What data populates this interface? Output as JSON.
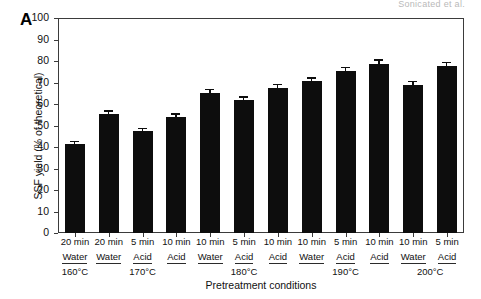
{
  "running_head": "Sonicated et al.",
  "panel_letter": "A",
  "chart_data": {
    "type": "bar",
    "title": "",
    "xlabel": "Pretreatment conditions",
    "ylabel": "SSF yield (% of theoretical)",
    "ylim": [
      0,
      100
    ],
    "yticks": [
      0,
      10,
      20,
      30,
      40,
      50,
      60,
      70,
      80,
      90,
      100
    ],
    "ytick_labels": [
      "0",
      "10",
      "20",
      "30",
      "40",
      "50",
      "60",
      "70",
      "80",
      "90",
      "100"
    ],
    "grid": false,
    "legend": "none",
    "bar_color": "#0d0d0d",
    "categories": [
      "20 min Acid 160°C",
      "20 min Water 170°C",
      "5 min Acid 170°C",
      "10 min Acid 170°C",
      "10 min Water 180°C",
      "5 min Acid 180°C",
      "10 min Acid 180°C",
      "10 min Water 190°C",
      "5 min Acid 190°C",
      "10 min Acid 190°C",
      "10 min Water 200°C",
      "5 min Acid 200°C"
    ],
    "values": [
      41.3,
      55.2,
      47.4,
      54.0,
      65.0,
      62.0,
      67.6,
      70.5,
      75.2,
      78.8,
      69.0,
      77.5
    ],
    "errors": [
      0.9,
      1.2,
      0.8,
      1.0,
      1.3,
      1.0,
      1.1,
      1.2,
      1.4,
      1.3,
      1.1,
      1.4
    ],
    "bars": [
      {
        "time": "20 min",
        "medium": "Water",
        "temp": "160°C",
        "value": 41.3,
        "error": 0.9
      },
      {
        "time": "20 min",
        "medium": "Water",
        "temp": "170°C",
        "value": 55.2,
        "error": 1.2
      },
      {
        "time": "5 min",
        "medium": "Acid",
        "temp": "170°C",
        "value": 47.4,
        "error": 0.8
      },
      {
        "time": "10 min",
        "medium": "Acid",
        "temp": "170°C",
        "value": 54.0,
        "error": 1.0
      },
      {
        "time": "10 min",
        "medium": "Water",
        "temp": "180°C",
        "value": 65.0,
        "error": 1.3
      },
      {
        "time": "5 min",
        "medium": "Acid",
        "temp": "180°C",
        "value": 62.0,
        "error": 1.0
      },
      {
        "time": "10 min",
        "medium": "Acid",
        "temp": "180°C",
        "value": 67.6,
        "error": 1.1
      },
      {
        "time": "10 min",
        "medium": "Water",
        "temp": "190°C",
        "value": 70.5,
        "error": 1.2
      },
      {
        "time": "5 min",
        "medium": "Acid",
        "temp": "190°C",
        "value": 75.2,
        "error": 1.4
      },
      {
        "time": "10 min",
        "medium": "Acid",
        "temp": "190°C",
        "value": 78.8,
        "error": 1.3
      },
      {
        "time": "10 min",
        "medium": "Water",
        "temp": "200°C",
        "value": 69.0,
        "error": 1.1
      },
      {
        "time": "5 min",
        "medium": "Acid",
        "temp": "200°C",
        "value": 77.5,
        "error": 1.4
      }
    ],
    "time_labels": [
      "20 min",
      "20 min",
      "5 min",
      "10 min",
      "10 min",
      "5 min",
      "10 min",
      "10 min",
      "5 min",
      "10 min",
      "10 min",
      "5 min"
    ],
    "medium_labels": [
      "Acid",
      "Water",
      "Acid",
      "Acid",
      "Water",
      "Acid",
      "Acid",
      "Water",
      "Acid",
      "Acid",
      "Water",
      "Acid"
    ],
    "temperature_groups": [
      {
        "label": "160°C",
        "start_index": 0,
        "span": 1
      },
      {
        "label": "170°C",
        "start_index": 1,
        "span": 3
      },
      {
        "label": "180°C",
        "start_index": 4,
        "span": 3
      },
      {
        "label": "190°C",
        "start_index": 7,
        "span": 3
      },
      {
        "label": "200°C",
        "start_index": 10,
        "span": 2
      }
    ]
  }
}
